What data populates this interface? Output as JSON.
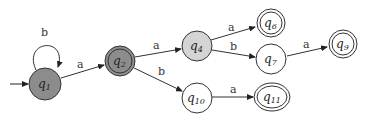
{
  "diagram": {
    "type": "finite-automaton",
    "states": [
      {
        "id": "q1",
        "base": "q",
        "sub": "1",
        "cx": 45,
        "cy": 83,
        "r": 16,
        "fill": "#8c8c8c",
        "accepting": false,
        "initial": true
      },
      {
        "id": "q2",
        "base": "q",
        "sub": "2",
        "cx": 120,
        "cy": 61,
        "r": 15,
        "fill": "#8c8c8c",
        "accepting": true,
        "initial": false
      },
      {
        "id": "q4",
        "base": "q",
        "sub": "4",
        "cx": 197,
        "cy": 46,
        "r": 15,
        "fill": "#d4d4d4",
        "accepting": false,
        "initial": false
      },
      {
        "id": "q6",
        "base": "q",
        "sub": "6",
        "cx": 271,
        "cy": 23,
        "r": 14,
        "fill": "#ffffff",
        "accepting": true,
        "initial": false
      },
      {
        "id": "q7",
        "base": "q",
        "sub": "7",
        "cx": 271,
        "cy": 59,
        "r": 15,
        "fill": "#ffffff",
        "accepting": false,
        "initial": false
      },
      {
        "id": "q9",
        "base": "q",
        "sub": "9",
        "cx": 343,
        "cy": 44,
        "r": 14,
        "fill": "#ffffff",
        "accepting": true,
        "initial": false
      },
      {
        "id": "q10",
        "base": "q",
        "sub": "10",
        "cx": 197,
        "cy": 98,
        "r": 15,
        "fill": "#ffffff",
        "accepting": false,
        "initial": false
      },
      {
        "id": "q11",
        "base": "q",
        "sub": "11",
        "cx": 272,
        "cy": 97,
        "r": 17,
        "fill": "#ffffff",
        "accepting": true,
        "initial": false
      }
    ],
    "transitions": [
      {
        "from": "q1",
        "to": "q1",
        "label": "b"
      },
      {
        "from": "q1",
        "to": "q2",
        "label": "a"
      },
      {
        "from": "q2",
        "to": "q4",
        "label": "a"
      },
      {
        "from": "q2",
        "to": "q10",
        "label": "b"
      },
      {
        "from": "q4",
        "to": "q6",
        "label": "a"
      },
      {
        "from": "q4",
        "to": "q7",
        "label": "b"
      },
      {
        "from": "q7",
        "to": "q9",
        "label": "a"
      },
      {
        "from": "q10",
        "to": "q11",
        "label": "a"
      }
    ]
  }
}
